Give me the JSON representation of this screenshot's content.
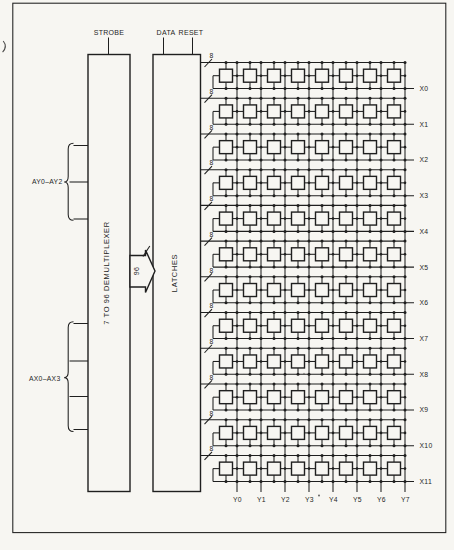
{
  "top_inputs": [
    {
      "label": "STROBE"
    },
    {
      "label": "DATA"
    },
    {
      "label": "RESET"
    }
  ],
  "demux": {
    "label": "7 TO 96 DEMULTIPLEXER"
  },
  "latches": {
    "label": "LATCHES"
  },
  "demux_to_latches_bus": {
    "width_label": "96"
  },
  "left_inputs": [
    {
      "label": "AY0–AY2",
      "line_count": 3
    },
    {
      "label": "AX0–AX3",
      "line_count": 4
    }
  ],
  "matrix": {
    "rows": 12,
    "cols": 8,
    "row_bus_width_label": "8",
    "row_labels": [
      "X0",
      "X1",
      "X2",
      "X3",
      "X4",
      "X5",
      "X6",
      "X7",
      "X8",
      "X9",
      "X10",
      "X11"
    ],
    "col_labels": [
      "Y0",
      "Y1",
      "Y2",
      "Y3",
      "Y4",
      "Y5",
      "Y6",
      "Y7"
    ]
  },
  "colors": {
    "ink": "#1f1f1f",
    "paper": "#f7f6f2"
  }
}
